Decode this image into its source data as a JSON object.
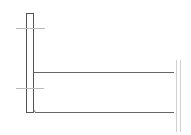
{
  "diagram": {
    "type": "technical-line-drawing",
    "canvas": {
      "width": 191,
      "height": 135,
      "background": "#ffffff"
    },
    "colors": {
      "stroke": "#555555",
      "light_stroke": "#bbbbbb",
      "break_stroke": "#d0d0d0"
    },
    "elements": {
      "vertical_post": {
        "x": 26,
        "y": 13,
        "width": 7,
        "height": 99
      },
      "top_reference_line": {
        "x1": 16,
        "y1": 28,
        "x2": 45,
        "y2": 28
      },
      "lower_reference_line": {
        "x1": 16,
        "y1": 88,
        "x2": 44,
        "y2": 88
      },
      "upper_beam_line": {
        "x1": 33,
        "y1": 72,
        "x2": 174,
        "y2": 72
      },
      "bottom_beam_line": {
        "x1": 33,
        "y1": 112,
        "x2": 174,
        "y2": 112
      },
      "break_marks": [
        {
          "x1": 176,
          "y1": 60,
          "x2": 176,
          "y2": 132
        },
        {
          "x1": 180,
          "y1": 60,
          "x2": 180,
          "y2": 132
        }
      ]
    }
  }
}
